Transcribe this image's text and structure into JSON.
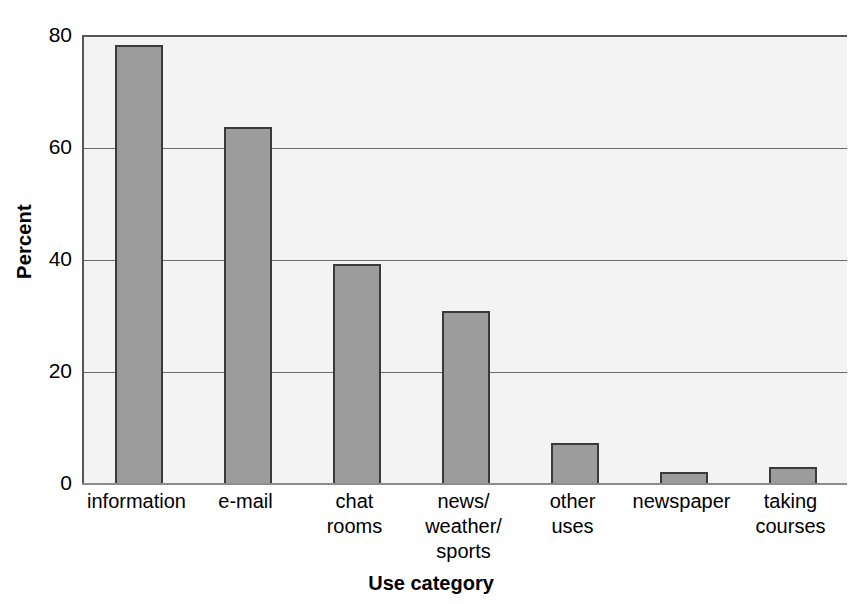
{
  "chart_data": {
    "type": "bar",
    "title": "",
    "xlabel": "Use category",
    "ylabel": "Percent",
    "categories": [
      "information",
      "e-mail",
      "chat\nrooms",
      "news/\nweather/\nsports",
      "other\nuses",
      "newspaper",
      "taking\ncourses"
    ],
    "values": [
      78.5,
      64,
      39.5,
      31,
      7.5,
      2.3,
      3.2
    ],
    "ylim": [
      0,
      80
    ],
    "yticks": [
      0,
      20,
      40,
      60,
      80
    ],
    "ytick_labels": [
      "0",
      "20",
      "40",
      "60",
      "80"
    ],
    "grid": true,
    "grid_axis": "y",
    "legend": "none",
    "bar_fill_color": "#9c9c9c",
    "bar_edge_color": "#3a3a3a",
    "plot_background_color": "#f3f3f3",
    "gridline_color": "#6a6a6a",
    "axis_color": "#555555",
    "text_color": "#000000"
  }
}
